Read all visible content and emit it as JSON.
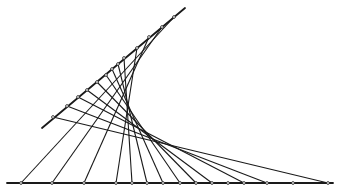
{
  "diagram": {
    "type": "string-art-envelope",
    "stroke_color": "#1a1a1a",
    "background": "#ffffff",
    "base_line": {
      "x1": 7,
      "y1": 183,
      "x2": 333,
      "y2": 183
    },
    "slant_line": {
      "x1": 42,
      "y1": 128,
      "x2": 185,
      "y2": 8
    },
    "top_points": [
      [
        174,
        17
      ],
      [
        162,
        27
      ],
      [
        149,
        37
      ],
      [
        137,
        48
      ],
      [
        124,
        58
      ],
      [
        118,
        64
      ],
      [
        112,
        69
      ],
      [
        106,
        75
      ],
      [
        97,
        82
      ],
      [
        87,
        90
      ],
      [
        78,
        97
      ],
      [
        67,
        106
      ],
      [
        53,
        117
      ]
    ],
    "bottom_points": [
      [
        21,
        183
      ],
      [
        52,
        183
      ],
      [
        84,
        183
      ],
      [
        116,
        183
      ],
      [
        132,
        183
      ],
      [
        147,
        183
      ],
      [
        163,
        183
      ],
      [
        180,
        183
      ],
      [
        196,
        183
      ],
      [
        212,
        183
      ],
      [
        228,
        183
      ],
      [
        244,
        183
      ],
      [
        267,
        183
      ],
      [
        293,
        183
      ],
      [
        328,
        183
      ]
    ],
    "connections": [
      [
        0,
        0
      ],
      [
        1,
        1
      ],
      [
        2,
        2
      ],
      [
        3,
        3
      ],
      [
        4,
        4
      ],
      [
        5,
        5
      ],
      [
        6,
        6
      ],
      [
        7,
        7
      ],
      [
        8,
        8
      ],
      [
        9,
        9
      ],
      [
        10,
        11
      ],
      [
        11,
        12
      ],
      [
        12,
        14
      ]
    ]
  }
}
